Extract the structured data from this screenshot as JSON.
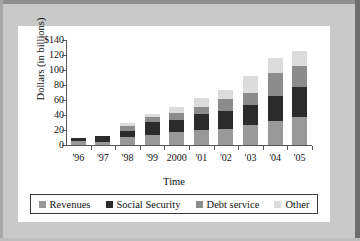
{
  "chart_data": {
    "type": "bar",
    "subtype": "stacked",
    "title": "",
    "xlabel": "Time",
    "ylabel": "Dollars (in billions)",
    "categories": [
      "'96",
      "'97",
      "'98",
      "'99",
      "2000",
      "'01",
      "'02",
      "'03",
      "'04",
      "'05"
    ],
    "ylim": [
      0,
      140
    ],
    "yticks": [
      0,
      20,
      40,
      60,
      80,
      100,
      120,
      140
    ],
    "ytick_labels": [
      "0",
      "20",
      "40",
      "60",
      "80",
      "100",
      "120",
      "$140"
    ],
    "grid": false,
    "legend_position": "bottom",
    "series": [
      {
        "name": "Revenues",
        "color": "#999999",
        "values": [
          5,
          4,
          11,
          14,
          18,
          20,
          22,
          27,
          32,
          37
        ]
      },
      {
        "name": "Social Security",
        "color": "#2b2b2b",
        "values": [
          4,
          8,
          8,
          17,
          16,
          21,
          23,
          27,
          34,
          40
        ]
      },
      {
        "name": "Debt service",
        "color": "#8c8c8c",
        "values": [
          0,
          0,
          7,
          6,
          9,
          10,
          17,
          16,
          30,
          28
        ]
      },
      {
        "name": "Other",
        "color": "#dcdcdc",
        "values": [
          0,
          0,
          4,
          5,
          8,
          12,
          12,
          22,
          20,
          20
        ]
      }
    ],
    "totals": [
      9,
      12,
      30,
      42,
      51,
      63,
      74,
      92,
      116,
      125
    ]
  },
  "legend": {
    "items": [
      {
        "label": "Revenues",
        "color": "#999999",
        "swatch_name": "revenues-swatch"
      },
      {
        "label": "Social Security",
        "color": "#2b2b2b",
        "swatch_name": "social-security-swatch"
      },
      {
        "label": "Debt service",
        "color": "#8c8c8c",
        "swatch_name": "debt-service-swatch"
      },
      {
        "label": "Other",
        "color": "#dcdcdc",
        "swatch_name": "other-swatch"
      }
    ]
  }
}
